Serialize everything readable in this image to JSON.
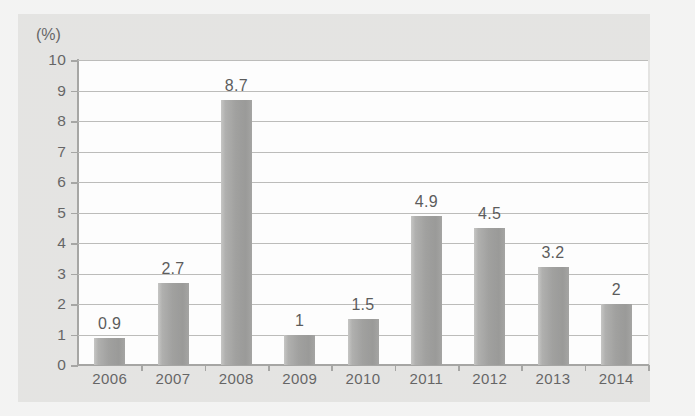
{
  "chart_data": {
    "type": "bar",
    "title": "",
    "subtitle": "",
    "xlabel": "",
    "ylabel": "",
    "unit_label": "(%)",
    "categories": [
      "2006",
      "2007",
      "2008",
      "2009",
      "2010",
      "2011",
      "2012",
      "2013",
      "2014"
    ],
    "values": [
      0.9,
      2.7,
      8.7,
      1,
      1.5,
      4.9,
      4.5,
      3.2,
      2
    ],
    "value_labels": [
      "0.9",
      "2.7",
      "8.7",
      "1",
      "1.5",
      "4.9",
      "4.5",
      "3.2",
      "2"
    ],
    "ylim": [
      0,
      10
    ],
    "ytick_step": 1,
    "ytick_labels": [
      "10",
      "9",
      "8",
      "7",
      "6",
      "5",
      "4",
      "3",
      "2",
      "1",
      "0"
    ],
    "grid": true,
    "grid_axis": "y",
    "legend": "none",
    "bar_color": "#868684",
    "grid_color": "#a9a9a7",
    "axis_color": "#8d8d8b",
    "text_color": "#3a3a3a",
    "plot_background": "#fdfdfd",
    "panel_background": "#dddcda",
    "page_background": "#f0f0ef"
  }
}
